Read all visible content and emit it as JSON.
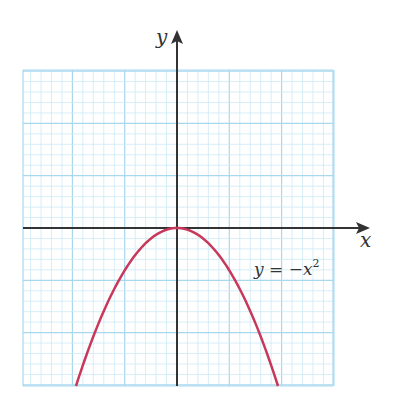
{
  "chart_data": {
    "type": "line",
    "title": "",
    "xlabel": "x",
    "ylabel": "y",
    "grid": true,
    "xlim": [
      -3,
      3
    ],
    "ylim": [
      -3.8,
      3.8
    ],
    "series": [
      {
        "name": "y = −x²",
        "equation": "y = -x^2",
        "x": [
          -1.95,
          -1.5,
          -1.0,
          -0.5,
          0,
          0.5,
          1.0,
          1.5,
          1.95
        ],
        "y": [
          -3.8,
          -2.25,
          -1.0,
          -0.25,
          0,
          -0.25,
          -1.0,
          -2.25,
          -3.8
        ]
      }
    ],
    "annotations": [
      {
        "text": "y = −x",
        "superscript": "2",
        "position": "right of curve, below x-axis"
      }
    ]
  },
  "labels": {
    "x_axis": "x",
    "y_axis": "y",
    "equation_main": "y = −x",
    "equation_exp": "2"
  },
  "colors": {
    "curve": "#c8385a",
    "axis": "#333333",
    "grid_minor": "#cdeaf6",
    "grid_major": "#a8d8ee"
  }
}
